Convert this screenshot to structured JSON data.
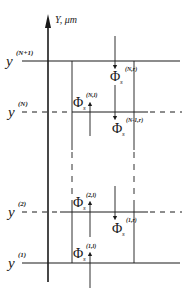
{
  "axis": {
    "label": "Y, μm"
  },
  "levels": [
    {
      "id": "yN1",
      "base": "y",
      "sup": "(N+1)",
      "style": "solid"
    },
    {
      "id": "yN",
      "base": "y",
      "sup": "(N)",
      "style": "dashed"
    },
    {
      "id": "y2",
      "base": "y",
      "sup": "(2)",
      "style": "dashed"
    },
    {
      "id": "y1",
      "base": "y",
      "sup": "(1)",
      "style": "solid"
    }
  ],
  "fluxes": [
    {
      "id": "phi_N_r",
      "base": "Φ",
      "sub": "s",
      "sup": "(N,r)",
      "direction": "down"
    },
    {
      "id": "phi_N_l",
      "base": "Φ",
      "sub": "s",
      "sup": "(N,l)",
      "direction": "up"
    },
    {
      "id": "phi_N1_r",
      "base": "Φ",
      "sub": "s",
      "sup": "(N-1,r)",
      "direction": "down"
    },
    {
      "id": "phi_2_l",
      "base": "Φ",
      "sub": "s",
      "sup": "(2,l)",
      "direction": "up"
    },
    {
      "id": "phi_1_r",
      "base": "Φ",
      "sub": "s",
      "sup": "(1,r)",
      "direction": "down"
    },
    {
      "id": "phi_1_l",
      "base": "Φ",
      "sub": "s",
      "sup": "(1,l)",
      "direction": "up"
    }
  ]
}
